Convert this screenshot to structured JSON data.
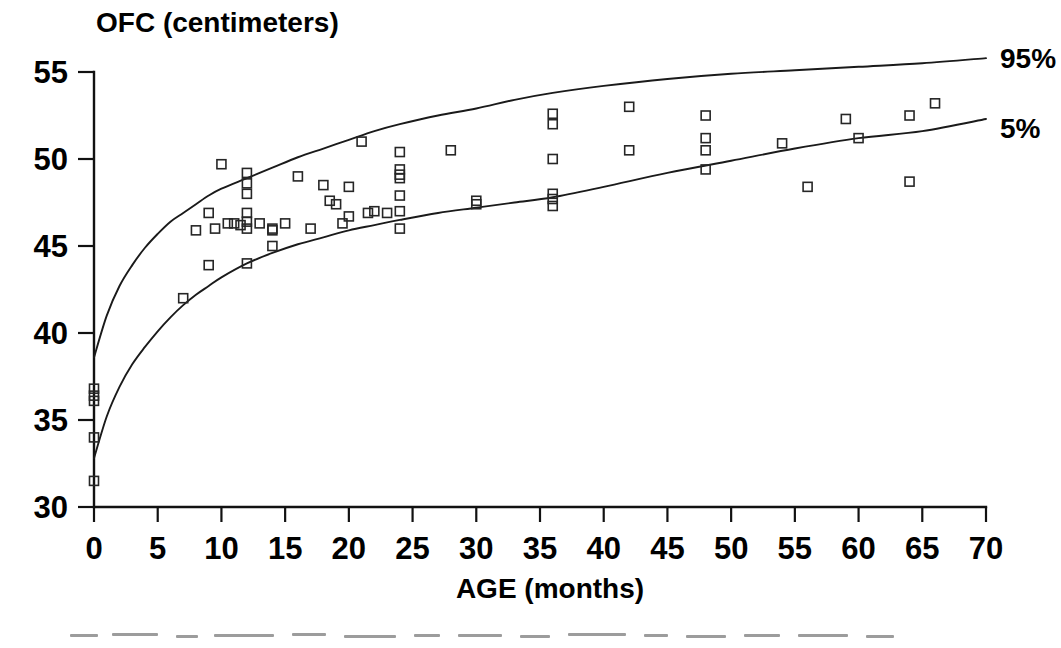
{
  "chart_data": {
    "type": "scatter",
    "title": "OFC (centimeters)",
    "subtitle": "",
    "xlabel": "AGE (months)",
    "ylabel": "OFC (centimeters)",
    "xlim": [
      0,
      70
    ],
    "ylim": [
      30,
      55
    ],
    "grid": false,
    "legend_position": "right-of-plot-end-of-curves",
    "x_ticks": [
      0,
      5,
      10,
      15,
      20,
      25,
      30,
      35,
      40,
      45,
      50,
      55,
      60,
      65,
      70
    ],
    "x_tick_labels": [
      "0",
      "5",
      "10",
      "15",
      "20",
      "25",
      "30",
      "35",
      "40",
      "45",
      "50",
      "55",
      "60",
      "65",
      "70"
    ],
    "y_ticks": [
      30,
      35,
      40,
      45,
      50,
      55
    ],
    "y_tick_labels": [
      "30",
      "35",
      "40",
      "45",
      "50",
      "55"
    ],
    "annotations": [
      {
        "text": "95%",
        "x": 70,
        "y": 55.8,
        "describes": "95th percentile reference curve"
      },
      {
        "text": "5%",
        "x": 70,
        "y": 51.8,
        "describes": "5th percentile reference curve"
      }
    ],
    "series": [
      {
        "name": "95%",
        "type": "line",
        "label": "95%",
        "x": [
          0,
          1,
          2,
          3,
          4,
          5,
          6,
          7,
          8,
          9,
          10,
          12,
          14,
          16,
          18,
          20,
          22,
          24,
          27,
          30,
          33,
          36,
          40,
          45,
          50,
          55,
          60,
          65,
          70
        ],
        "y": [
          38.6,
          41.0,
          42.7,
          43.9,
          44.9,
          45.7,
          46.4,
          46.9,
          47.4,
          47.9,
          48.3,
          48.9,
          49.5,
          50.1,
          50.6,
          51.1,
          51.6,
          52.0,
          52.5,
          52.9,
          53.4,
          53.8,
          54.2,
          54.6,
          54.9,
          55.1,
          55.3,
          55.5,
          55.8
        ]
      },
      {
        "name": "5%",
        "type": "line",
        "label": "5%",
        "x": [
          0,
          1,
          2,
          3,
          4,
          5,
          6,
          7,
          8,
          9,
          10,
          12,
          14,
          16,
          18,
          20,
          22,
          24,
          27,
          30,
          33,
          36,
          40,
          45,
          50,
          55,
          60,
          65,
          70
        ],
        "y": [
          32.8,
          35.2,
          36.9,
          38.2,
          39.2,
          40.1,
          40.9,
          41.6,
          42.2,
          42.7,
          43.2,
          44.0,
          44.6,
          45.1,
          45.5,
          45.9,
          46.2,
          46.5,
          46.9,
          47.2,
          47.5,
          47.8,
          48.4,
          49.2,
          49.9,
          50.6,
          51.2,
          51.6,
          52.3
        ]
      },
      {
        "name": "patients",
        "type": "scatter",
        "marker": "open-square",
        "points": [
          {
            "x": 0.0,
            "y": 36.8
          },
          {
            "x": 0.0,
            "y": 36.4
          },
          {
            "x": 0.0,
            "y": 36.1
          },
          {
            "x": 0.0,
            "y": 34.0
          },
          {
            "x": 0.0,
            "y": 31.5
          },
          {
            "x": 7.0,
            "y": 42.0
          },
          {
            "x": 8.0,
            "y": 45.9
          },
          {
            "x": 9.0,
            "y": 46.9
          },
          {
            "x": 9.0,
            "y": 43.9
          },
          {
            "x": 9.5,
            "y": 46.0
          },
          {
            "x": 10.0,
            "y": 49.7
          },
          {
            "x": 10.5,
            "y": 46.3
          },
          {
            "x": 11.0,
            "y": 46.3
          },
          {
            "x": 11.5,
            "y": 46.2
          },
          {
            "x": 12.0,
            "y": 49.2
          },
          {
            "x": 12.0,
            "y": 48.6
          },
          {
            "x": 12.0,
            "y": 48.0
          },
          {
            "x": 12.0,
            "y": 46.9
          },
          {
            "x": 12.0,
            "y": 46.4
          },
          {
            "x": 12.0,
            "y": 46.0
          },
          {
            "x": 12.0,
            "y": 44.0
          },
          {
            "x": 13.0,
            "y": 46.3
          },
          {
            "x": 14.0,
            "y": 46.0
          },
          {
            "x": 14.0,
            "y": 45.9
          },
          {
            "x": 14.0,
            "y": 45.0
          },
          {
            "x": 15.0,
            "y": 46.3
          },
          {
            "x": 16.0,
            "y": 49.0
          },
          {
            "x": 17.0,
            "y": 46.0
          },
          {
            "x": 18.0,
            "y": 48.5
          },
          {
            "x": 18.5,
            "y": 47.6
          },
          {
            "x": 19.0,
            "y": 47.4
          },
          {
            "x": 19.5,
            "y": 46.3
          },
          {
            "x": 20.0,
            "y": 48.4
          },
          {
            "x": 20.0,
            "y": 46.7
          },
          {
            "x": 21.0,
            "y": 51.0
          },
          {
            "x": 21.5,
            "y": 46.9
          },
          {
            "x": 22.0,
            "y": 47.0
          },
          {
            "x": 23.0,
            "y": 46.9
          },
          {
            "x": 24.0,
            "y": 50.4
          },
          {
            "x": 24.0,
            "y": 49.4
          },
          {
            "x": 24.0,
            "y": 49.1
          },
          {
            "x": 24.0,
            "y": 48.9
          },
          {
            "x": 24.0,
            "y": 47.9
          },
          {
            "x": 24.0,
            "y": 47.0
          },
          {
            "x": 24.0,
            "y": 46.0
          },
          {
            "x": 28.0,
            "y": 50.5
          },
          {
            "x": 30.0,
            "y": 47.6
          },
          {
            "x": 30.0,
            "y": 47.4
          },
          {
            "x": 36.0,
            "y": 52.6
          },
          {
            "x": 36.0,
            "y": 52.0
          },
          {
            "x": 36.0,
            "y": 50.0
          },
          {
            "x": 36.0,
            "y": 48.0
          },
          {
            "x": 36.0,
            "y": 47.7
          },
          {
            "x": 36.0,
            "y": 47.3
          },
          {
            "x": 42.0,
            "y": 53.0
          },
          {
            "x": 42.0,
            "y": 50.5
          },
          {
            "x": 48.0,
            "y": 52.5
          },
          {
            "x": 48.0,
            "y": 51.2
          },
          {
            "x": 48.0,
            "y": 50.5
          },
          {
            "x": 48.0,
            "y": 49.4
          },
          {
            "x": 54.0,
            "y": 50.9
          },
          {
            "x": 56.0,
            "y": 48.4
          },
          {
            "x": 59.0,
            "y": 52.3
          },
          {
            "x": 60.0,
            "y": 51.2
          },
          {
            "x": 64.0,
            "y": 52.5
          },
          {
            "x": 64.0,
            "y": 48.7
          },
          {
            "x": 66.0,
            "y": 53.2
          }
        ]
      }
    ]
  },
  "colors": {
    "background": "#ffffff",
    "ink": "#000000",
    "curve": "#1a1a1a",
    "marker": "#262626"
  }
}
